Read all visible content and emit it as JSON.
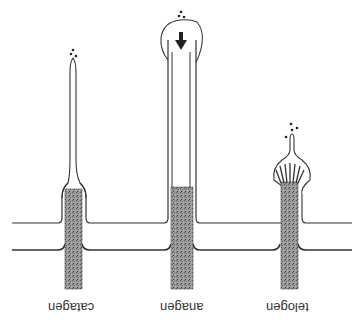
{
  "diagram": {
    "orientation": "rotated 180 degrees",
    "phases": [
      {
        "name": "catagen",
        "label": "catagen"
      },
      {
        "name": "anagen",
        "label": "anagen"
      },
      {
        "name": "telogen",
        "label": "telogen"
      }
    ],
    "colors": {
      "line": "#333333",
      "shaft": "#8a8a8a",
      "background": "#ffffff"
    }
  }
}
